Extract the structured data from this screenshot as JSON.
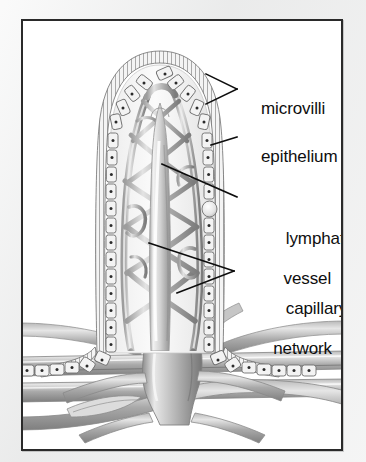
{
  "figure": {
    "frame_border_color": "#2a2a2a",
    "background_color": "#ffffff",
    "margin_color": "#eceded",
    "ink_color": "#0e0e0e"
  },
  "labels": [
    {
      "id": "microvilli",
      "text": "microvilli",
      "name": "label-microvilli",
      "leader": "fork"
    },
    {
      "id": "epithelium",
      "text": "epithelium",
      "name": "label-epithelium",
      "leader": "single"
    },
    {
      "id": "lymphatic",
      "text": "lymphatic",
      "text_line2": "vessel",
      "name": "label-lymphatic-vessel",
      "leader": "single"
    },
    {
      "id": "capillary",
      "text": "capillary",
      "text_line2": "network",
      "name": "label-capillary-network",
      "leader": "fork"
    }
  ],
  "anatomy": {
    "villus_outline": "finger-like projection with domed apex and flared base",
    "epithelium_cells": "columnar cells with dark nuclei forming a single layer around the villus",
    "microvilli": "brush border hatching on outer surface of epithelium",
    "lacteal": "central pale lymphatic vessel running the length of the villus",
    "capillary_network": "braided vascular mesh surrounding the central lacteal",
    "submucosa": "horizontal arteriole, venule and lymphatic trunks at the base"
  },
  "palette": {
    "vessel_mid": "#9a9a9a",
    "vessel_light": "#d8d8d8",
    "vessel_dark": "#6e6e6e",
    "cell_fill": "#f2f2f2",
    "cell_stroke": "#7d7d7d",
    "nucleus": "#2e2e2e"
  }
}
